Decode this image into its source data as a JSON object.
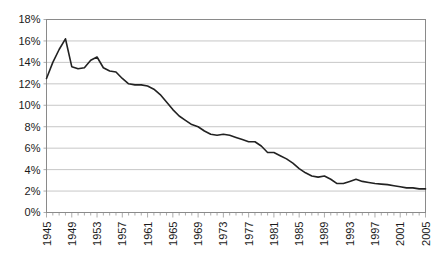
{
  "chart_data": {
    "type": "line",
    "title": "",
    "subtitle": "",
    "xlabel": "",
    "ylabel": "",
    "xlim": [
      1945,
      2005
    ],
    "ylim": [
      0,
      18
    ],
    "grid": true,
    "legend": null,
    "y_tick_labels": [
      "18%",
      "16%",
      "14%",
      "12%",
      "10%",
      "8%",
      "6%",
      "4%",
      "2%",
      "0%"
    ],
    "y_ticks": [
      18,
      16,
      14,
      12,
      10,
      8,
      6,
      4,
      2,
      0
    ],
    "x_tick_labels": [
      "1945",
      "1949",
      "1953",
      "1957",
      "1961",
      "1965",
      "1969",
      "1973",
      "1977",
      "1981",
      "1985",
      "1989",
      "1993",
      "1997",
      "2001",
      "2005"
    ],
    "x_ticks": [
      1945,
      1949,
      1953,
      1957,
      1961,
      1965,
      1969,
      1973,
      1977,
      1981,
      1985,
      1989,
      1993,
      1997,
      2001,
      2005
    ],
    "x": [
      1945,
      1946,
      1947,
      1948,
      1949,
      1950,
      1951,
      1952,
      1953,
      1954,
      1955,
      1956,
      1957,
      1958,
      1959,
      1960,
      1961,
      1962,
      1963,
      1964,
      1965,
      1966,
      1967,
      1968,
      1969,
      1970,
      1971,
      1972,
      1973,
      1974,
      1975,
      1976,
      1977,
      1978,
      1979,
      1980,
      1981,
      1982,
      1983,
      1984,
      1985,
      1986,
      1987,
      1988,
      1989,
      1990,
      1991,
      1992,
      1993,
      1994,
      1995,
      1996,
      1997,
      1998,
      1999,
      2000,
      2001,
      2002,
      2003,
      2004,
      2005
    ],
    "values": [
      12.5,
      14.0,
      15.2,
      16.2,
      13.6,
      13.4,
      13.5,
      14.2,
      14.5,
      13.5,
      13.2,
      13.1,
      12.5,
      12.0,
      11.9,
      11.9,
      11.8,
      11.5,
      11.0,
      10.3,
      9.6,
      9.0,
      8.6,
      8.2,
      8.0,
      7.6,
      7.3,
      7.2,
      7.3,
      7.2,
      7.0,
      6.8,
      6.6,
      6.6,
      6.2,
      5.6,
      5.6,
      5.3,
      5.0,
      4.6,
      4.1,
      3.7,
      3.4,
      3.3,
      3.4,
      3.1,
      2.7,
      2.7,
      2.9,
      3.1,
      2.9,
      2.8,
      2.7,
      2.65,
      2.6,
      2.5,
      2.4,
      2.3,
      2.3,
      2.2,
      2.2
    ],
    "series_name": "percent",
    "line_color": "#222222",
    "grid_color": "#b9b9b9",
    "axis_color": "#8a8a8a",
    "background_color": "#ffffff"
  }
}
